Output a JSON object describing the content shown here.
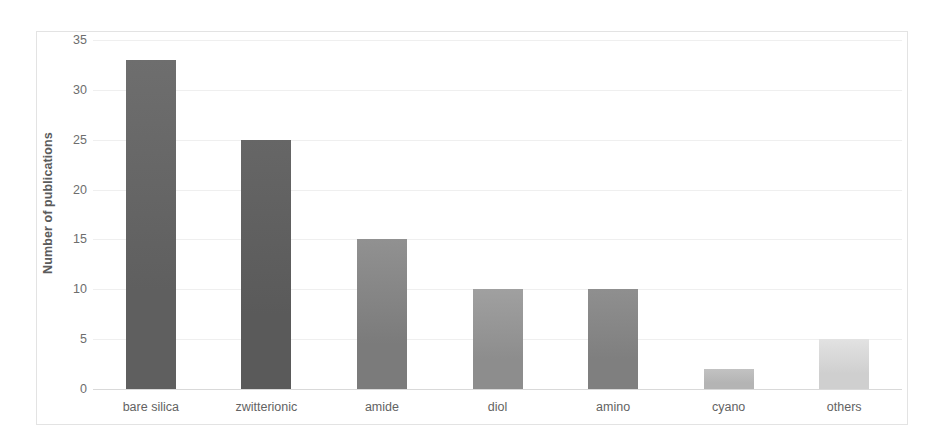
{
  "chart_data": {
    "type": "bar",
    "title": "",
    "xlabel": "",
    "ylabel": "Number of publications",
    "categories": [
      "bare silica",
      "zwitterionic",
      "amide",
      "diol",
      "amino",
      "cyano",
      "others"
    ],
    "values": [
      33,
      25,
      15,
      10,
      10,
      2,
      5
    ],
    "ylim": [
      0,
      35
    ],
    "ytick_labels": [
      "0",
      "5",
      "10",
      "15",
      "20",
      "25",
      "30",
      "35"
    ],
    "ytick_values": [
      0,
      5,
      10,
      15,
      20,
      25,
      30,
      35
    ],
    "grid": "horizontal",
    "legend": "none",
    "bar_colors": [
      "#5f5f5f",
      "#5a5a5a",
      "#7b7b7b",
      "#8d8d8d",
      "#7f7f7f",
      "#b4b4b4",
      "#cfcfcf"
    ],
    "bar_colors_top": [
      "#6e6e6e",
      "#666666",
      "#919191",
      "#a0a0a0",
      "#8f8f8f",
      "#c2c2c2",
      "#e2e2e2"
    ],
    "background_color": "#ffffff",
    "frame_color": "#e3e3e3",
    "gridline_color": "#efefef",
    "axis_color": "#d9d9d9",
    "tick_text_color": "#6d6d6d",
    "category_text_color": "#636363",
    "axis_title_color": "#5b5b5b"
  }
}
